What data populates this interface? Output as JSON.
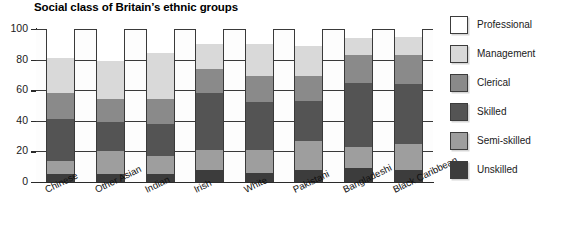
{
  "chart_data": {
    "type": "bar",
    "subtype": "stacked-percentage-column",
    "title": "Social class of Britain’s ethnic groups",
    "xlabel": "",
    "ylabel": "Percent",
    "ylim": [
      0,
      100
    ],
    "yticks": [
      0,
      20,
      40,
      60,
      80,
      100
    ],
    "grid": true,
    "legend_position": "right",
    "categories": [
      "Chinese",
      "Other Asian",
      "Indian",
      "Irish",
      "White",
      "Pakistani",
      "Bangladeshi",
      "Black Caribbean"
    ],
    "series": [
      {
        "name": "Professional",
        "color": "#ffffff",
        "values": [
          19,
          21,
          16,
          10,
          10,
          11,
          6,
          5
        ]
      },
      {
        "name": "Management",
        "color": "#d9d9d9",
        "values": [
          23,
          25,
          30,
          16,
          21,
          20,
          11,
          12
        ]
      },
      {
        "name": "Clerical",
        "color": "#8a8a8a",
        "values": [
          17,
          15,
          16,
          16,
          17,
          16,
          18,
          19
        ]
      },
      {
        "name": "Skilled",
        "color": "#545454",
        "values": [
          27,
          19,
          21,
          37,
          31,
          26,
          42,
          39
        ]
      },
      {
        "name": "Semi-skilled",
        "color": "#9e9e9e",
        "values": [
          9,
          15,
          12,
          13,
          15,
          19,
          14,
          17
        ]
      },
      {
        "name": "Unskilled",
        "color": "#3c3c3c",
        "values": [
          5,
          5,
          5,
          8,
          6,
          8,
          9,
          8
        ]
      }
    ],
    "legend_entries": [
      {
        "label": "Professional",
        "color": "#ffffff"
      },
      {
        "label": "Management",
        "color": "#d9d9d9"
      },
      {
        "label": "Clerical",
        "color": "#8a8a8a"
      },
      {
        "label": "Skilled",
        "color": "#545454"
      },
      {
        "label": "Semi-skilled",
        "color": "#9e9e9e"
      },
      {
        "label": "Unskilled",
        "color": "#3c3c3c"
      }
    ]
  }
}
